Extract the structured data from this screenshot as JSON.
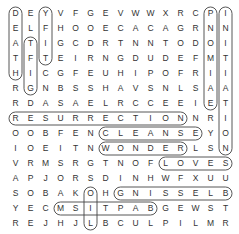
{
  "puzzle": {
    "type": "word-search",
    "rows": 15,
    "cols": 15,
    "grid": [
      "DEYVFGEVWWXRCPI",
      "ELFHOOECACAGRNN",
      "ATIGCDRTNNTODOI",
      "TFTEIRNGDUDEFMT",
      "HICGFEUHIPOFRII",
      "RGNBSSHAVSNLSAA",
      "RDASAELRCCEEIET",
      "RESURRECTIONNRI",
      "OOBFENCLEANSEYO",
      "IOEITNWONDERLSN",
      "VRMSRGTNOFLOVES",
      "APJORSDINHWFXUU",
      "SOBAKOHGNISSELB",
      "YECMSITPABGEWST",
      "REJHJLBCULPILMR"
    ],
    "found_words": [
      {
        "word": "DEATH",
        "start": [
          0,
          0
        ],
        "end": [
          4,
          0
        ]
      },
      {
        "word": "YIFT",
        "start": [
          0,
          2
        ],
        "end": [
          3,
          2
        ]
      },
      {
        "word": "TFIG",
        "start": [
          2,
          1
        ],
        "end": [
          5,
          1
        ]
      },
      {
        "word": "PROMISE",
        "start": [
          0,
          13
        ],
        "end": [
          6,
          13
        ]
      },
      {
        "word": "INITIATION",
        "start": [
          0,
          14
        ],
        "end": [
          9,
          14
        ]
      },
      {
        "word": "RESURRECTION",
        "start": [
          7,
          0
        ],
        "end": [
          7,
          11
        ]
      },
      {
        "word": "CLEANSE",
        "start": [
          8,
          6
        ],
        "end": [
          8,
          12
        ]
      },
      {
        "word": "WONDER",
        "start": [
          9,
          6
        ],
        "end": [
          9,
          11
        ]
      },
      {
        "word": "LOVES",
        "start": [
          10,
          10
        ],
        "end": [
          10,
          14
        ]
      },
      {
        "word": "BLESSING",
        "start": [
          12,
          14
        ],
        "end": [
          12,
          7
        ]
      },
      {
        "word": "BAPTISM",
        "start": [
          13,
          9
        ],
        "end": [
          13,
          3
        ]
      },
      {
        "word": "OIL",
        "start": [
          12,
          5
        ],
        "end": [
          14,
          5
        ]
      }
    ]
  }
}
